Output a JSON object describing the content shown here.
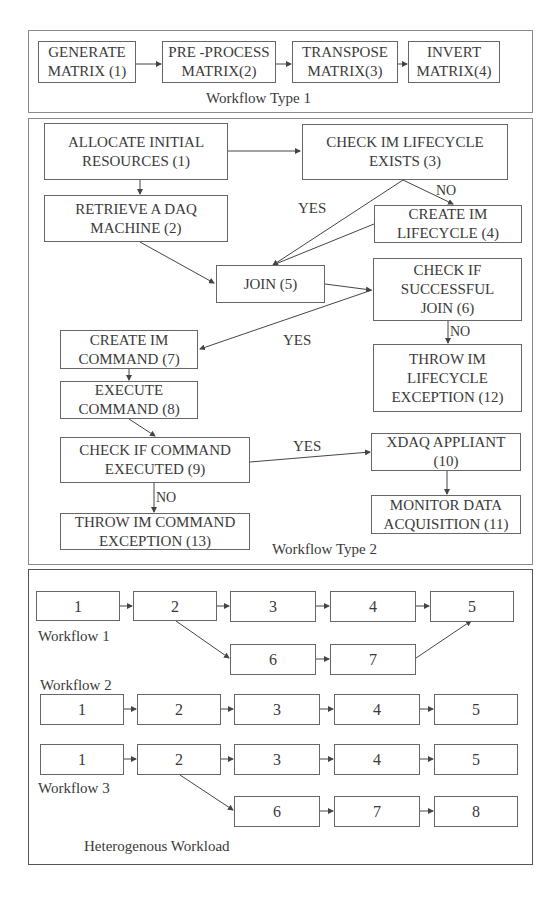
{
  "workflow_type_1": {
    "caption": "Workflow Type 1",
    "nodes": [
      {
        "id": 1,
        "label": "GENERATE\nMATRIX (1)"
      },
      {
        "id": 2,
        "label": "PRE -PROCESS\nMATRIX(2)"
      },
      {
        "id": 3,
        "label": "TRANSPOSE\nMATRIX(3)"
      },
      {
        "id": 4,
        "label": "INVERT\nMATRIX(4)"
      }
    ],
    "edges": [
      [
        1,
        2
      ],
      [
        2,
        3
      ],
      [
        3,
        4
      ]
    ]
  },
  "workflow_type_2": {
    "caption": "Workflow Type 2",
    "nodes": [
      {
        "id": 1,
        "label": "ALLOCATE INITIAL\nRESOURCES   (1)"
      },
      {
        "id": 2,
        "label": "RETRIEVE A DAQ\nMACHINE (2)"
      },
      {
        "id": 3,
        "label": "CHECK IM LIFECYCLE\nEXISTS (3)"
      },
      {
        "id": 4,
        "label": "CREATE IM\nLIFECYCLE (4)"
      },
      {
        "id": 5,
        "label": "JOIN (5)"
      },
      {
        "id": 6,
        "label": "CHECK IF\nSUCCESSFUL\nJOIN (6)"
      },
      {
        "id": 7,
        "label": "CREATE IM\nCOMMAND (7)"
      },
      {
        "id": 8,
        "label": "EXECUTE\nCOMMAND (8)"
      },
      {
        "id": 9,
        "label": "CHECK IF COMMAND\nEXECUTED (9)"
      },
      {
        "id": 10,
        "label": "XDAQ APPLIANT\n(10)"
      },
      {
        "id": 11,
        "label": "MONITOR DATA\nACQUISITION (11)"
      },
      {
        "id": 12,
        "label": "THROW IM\nLIFECYCLE\nEXCEPTION (12)"
      },
      {
        "id": 13,
        "label": "THROW IM COMMAND\nEXCEPTION (13)"
      }
    ],
    "edge_labels": {
      "yes_3_5": "YES",
      "no_3_4": "NO",
      "yes_6_7": "YES",
      "no_6_12": "NO",
      "yes_9_10": "YES",
      "no_9_13": "NO"
    },
    "edges": [
      [
        1,
        3
      ],
      [
        1,
        2
      ],
      [
        2,
        5
      ],
      [
        3,
        5
      ],
      [
        3,
        4
      ],
      [
        4,
        5
      ],
      [
        5,
        6
      ],
      [
        6,
        7
      ],
      [
        6,
        12
      ],
      [
        7,
        8
      ],
      [
        8,
        9
      ],
      [
        9,
        10
      ],
      [
        9,
        13
      ],
      [
        10,
        11
      ]
    ]
  },
  "heterogenous_workload": {
    "caption": "Heterogenous Workload",
    "workflows": [
      {
        "label": "Workflow 1",
        "main_row": [
          "1",
          "2",
          "3",
          "4",
          "5"
        ],
        "branch_row": [
          "6",
          "7"
        ],
        "edges": [
          [
            "1",
            "2"
          ],
          [
            "2",
            "3"
          ],
          [
            "3",
            "4"
          ],
          [
            "4",
            "5"
          ],
          [
            "2",
            "6"
          ],
          [
            "6",
            "7"
          ],
          [
            "7",
            "5"
          ]
        ]
      },
      {
        "label": "Workflow 2",
        "main_row": [
          "1",
          "2",
          "3",
          "4",
          "5"
        ],
        "edges": [
          [
            "1",
            "2"
          ],
          [
            "2",
            "3"
          ],
          [
            "3",
            "4"
          ],
          [
            "4",
            "5"
          ]
        ]
      },
      {
        "label": "Workflow 3",
        "main_row": [
          "1",
          "2",
          "3",
          "4",
          "5"
        ],
        "branch_row": [
          "6",
          "7",
          "8"
        ],
        "edges": [
          [
            "1",
            "2"
          ],
          [
            "2",
            "3"
          ],
          [
            "3",
            "4"
          ],
          [
            "4",
            "5"
          ],
          [
            "2",
            "6"
          ],
          [
            "6",
            "7"
          ],
          [
            "7",
            "8"
          ]
        ]
      }
    ]
  }
}
